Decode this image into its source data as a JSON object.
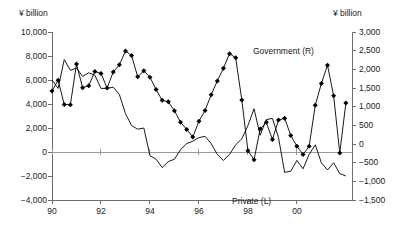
{
  "chart_data": {
    "type": "line",
    "title": "",
    "xlabel": "",
    "ylabel": "¥ billion",
    "left_axis": {
      "label": "¥ billion",
      "ticks": [
        "10,000",
        "8,000",
        "6,000",
        "4,000",
        "2,000",
        "0",
        "−2,000",
        "−4,000"
      ],
      "tick_values": [
        10000,
        8000,
        6000,
        4000,
        2000,
        0,
        -2000,
        -4000
      ],
      "ylim": [
        -4000,
        10000
      ]
    },
    "right_axis": {
      "label": "¥ billion",
      "ticks": [
        "3,000",
        "2,500",
        "2,000",
        "1,500",
        "1,000",
        "500",
        "0",
        "−500",
        "−1,000",
        "−1,500"
      ],
      "tick_values": [
        3000,
        2500,
        2000,
        1500,
        1000,
        500,
        0,
        -500,
        -1000,
        -1500
      ],
      "ylim": [
        -1500,
        3000
      ]
    },
    "x": {
      "tick_labels": [
        "90",
        "92",
        "94",
        "96",
        "98",
        "00"
      ],
      "tick_positions": [
        1990,
        1992,
        1994,
        1996,
        1998,
        2000
      ],
      "xlim": [
        1990,
        2002.25
      ]
    },
    "grid": false,
    "legend_position": "inline-annotation",
    "series": [
      {
        "name": "Government (R)",
        "axis": "right",
        "marker": "diamond",
        "label_text": "Government (R)",
        "x": [
          1990.0,
          1990.25,
          1990.5,
          1990.75,
          1991.0,
          1991.25,
          1991.5,
          1991.75,
          1992.0,
          1992.25,
          1992.5,
          1992.75,
          1993.0,
          1993.25,
          1993.5,
          1993.75,
          1994.0,
          1994.25,
          1994.5,
          1994.75,
          1995.0,
          1995.25,
          1995.5,
          1995.75,
          1996.0,
          1996.25,
          1996.5,
          1996.75,
          1997.0,
          1997.25,
          1997.5,
          1997.75,
          1998.0,
          1998.25,
          1998.5,
          1998.75,
          1999.0,
          1999.25,
          1999.5,
          1999.75,
          2000.0,
          2000.25,
          2000.5,
          2000.75,
          2001.0,
          2001.25,
          2001.5,
          2001.75,
          2002.0
        ],
        "values": [
          1420,
          1710,
          1060,
          1050,
          2140,
          1510,
          1560,
          1940,
          1890,
          1500,
          1930,
          2120,
          2490,
          2370,
          1800,
          1960,
          1790,
          1460,
          1170,
          1130,
          890,
          580,
          390,
          190,
          610,
          900,
          1320,
          1690,
          2030,
          2420,
          2310,
          1180,
          -180,
          -420,
          400,
          580,
          120,
          640,
          690,
          230,
          -60,
          -280,
          -60,
          1040,
          1620,
          2110,
          1290,
          -240,
          1100
        ]
      },
      {
        "name": "Private (L)",
        "axis": "left",
        "marker": "none",
        "label_text": "Private (L)",
        "x": [
          1990.0,
          1990.25,
          1990.5,
          1990.75,
          1991.0,
          1991.25,
          1991.5,
          1991.75,
          1992.0,
          1992.25,
          1992.5,
          1992.75,
          1993.0,
          1993.25,
          1993.5,
          1993.75,
          1994.0,
          1994.25,
          1994.5,
          1994.75,
          1995.0,
          1995.25,
          1995.5,
          1995.75,
          1996.0,
          1996.25,
          1996.5,
          1996.75,
          1997.0,
          1997.25,
          1997.5,
          1997.75,
          1998.0,
          1998.25,
          1998.5,
          1998.75,
          1999.0,
          1999.25,
          1999.5,
          1999.75,
          2000.0,
          2000.25,
          2000.5,
          2000.75,
          2001.0,
          2001.25,
          2001.5,
          2001.75,
          2002.0
        ],
        "values": [
          6000,
          5300,
          7700,
          6800,
          7000,
          6300,
          6600,
          6400,
          5300,
          5300,
          5400,
          4800,
          3200,
          2200,
          1900,
          2000,
          -300,
          -600,
          -1300,
          -800,
          -600,
          200,
          700,
          900,
          1200,
          1300,
          700,
          -200,
          -700,
          -200,
          600,
          1100,
          2200,
          3600,
          1400,
          2700,
          2800,
          1200,
          -1700,
          -1600,
          -700,
          -1400,
          -200,
          600,
          -900,
          -1500,
          -900,
          -1800,
          -2000
        ]
      }
    ]
  },
  "annotations": {
    "government_label": "Government (R)",
    "private_label": "Private (L)"
  },
  "colors": {
    "line": "#000000",
    "marker": "#000000",
    "axis": "#6e6e6e",
    "zero_line": "#9a9a9a",
    "text": "#1a1a1a",
    "background": "#ffffff"
  }
}
